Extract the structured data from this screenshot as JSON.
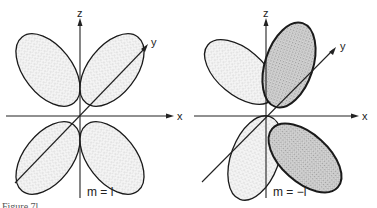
{
  "figure": {
    "caption_fragment": "Figure 7l",
    "panels": [
      {
        "id": "left",
        "label": "m = l",
        "axes": {
          "z": "z",
          "y": "y",
          "x": "x"
        },
        "shading": "uniform stippled lobes"
      },
      {
        "id": "right",
        "label": "m = −l",
        "axes": {
          "z": "z",
          "y": "y",
          "x": "x"
        },
        "shading": "alternating light and dark stippled lobes"
      }
    ]
  },
  "colors": {
    "ink": "#222222",
    "light_stipple": "#e6e6e6",
    "dark_stipple": "#b9b9b9"
  }
}
